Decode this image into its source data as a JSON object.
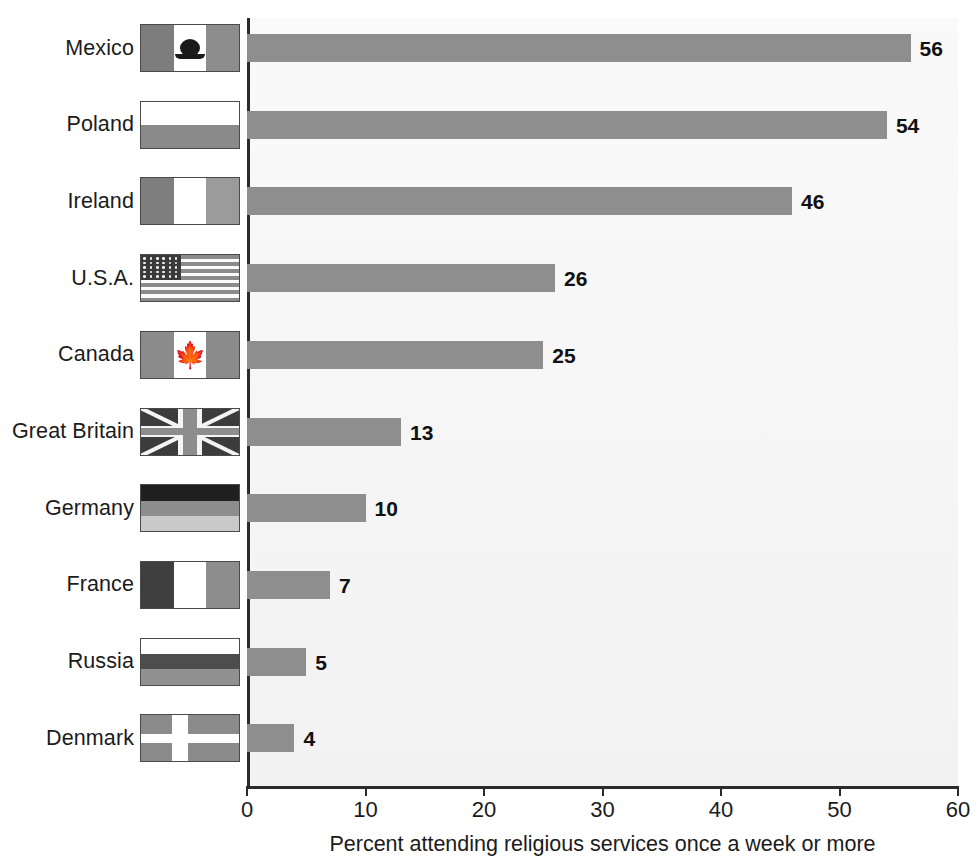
{
  "chart_data": {
    "type": "bar",
    "orientation": "horizontal",
    "title": "",
    "xlabel": "Percent attending religious services once a week or more",
    "ylabel": "",
    "xlim": [
      0,
      60
    ],
    "xticks": [
      0,
      10,
      20,
      30,
      40,
      50,
      60
    ],
    "xtick_labels": [
      "0",
      "10",
      "20",
      "30",
      "40",
      "50",
      "60"
    ],
    "grid": false,
    "legend": false,
    "categories": [
      "Mexico",
      "Poland",
      "Ireland",
      "U.S.A.",
      "Canada",
      "Great Britain",
      "Germany",
      "France",
      "Russia",
      "Denmark"
    ],
    "values": [
      56,
      54,
      46,
      26,
      25,
      13,
      10,
      7,
      5,
      4
    ],
    "data_labels": [
      "56",
      "54",
      "46",
      "26",
      "25",
      "13",
      "10",
      "7",
      "5",
      "4"
    ],
    "bar_color": "#8e8e8e",
    "plot_background": "#f3f3f3",
    "axis_color": "#2b2b2b"
  },
  "rows": [
    {
      "label": "Mexico",
      "value": 56,
      "data_label": "56",
      "flag": "mexico-flag"
    },
    {
      "label": "Poland",
      "value": 54,
      "data_label": "54",
      "flag": "poland-flag"
    },
    {
      "label": "Ireland",
      "value": 46,
      "data_label": "46",
      "flag": "ireland-flag"
    },
    {
      "label": "U.S.A.",
      "value": 26,
      "data_label": "26",
      "flag": "usa-flag"
    },
    {
      "label": "Canada",
      "value": 25,
      "data_label": "25",
      "flag": "canada-flag"
    },
    {
      "label": "Great Britain",
      "value": 13,
      "data_label": "13",
      "flag": "great-britain-flag"
    },
    {
      "label": "Germany",
      "value": 10,
      "data_label": "10",
      "flag": "germany-flag"
    },
    {
      "label": "France",
      "value": 7,
      "data_label": "7",
      "flag": "france-flag"
    },
    {
      "label": "Russia",
      "value": 5,
      "data_label": "5",
      "flag": "russia-flag"
    },
    {
      "label": "Denmark",
      "value": 4,
      "data_label": "4",
      "flag": "denmark-flag"
    }
  ],
  "axis": {
    "x_title": "Percent attending religious services once a week or more",
    "ticks": [
      "0",
      "10",
      "20",
      "30",
      "40",
      "50",
      "60"
    ]
  }
}
